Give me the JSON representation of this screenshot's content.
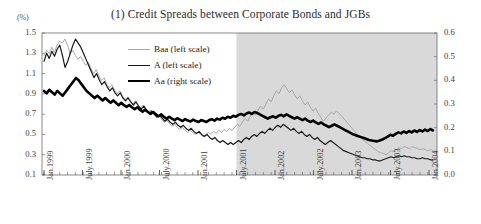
{
  "chart_data": {
    "type": "line",
    "title": "(1) Credit Spreads between Corporate Bonds and JGBs",
    "unit_label": "(%)",
    "xlabel": "",
    "ylabel_left": "",
    "ylabel_right": "",
    "grid": false,
    "legend_position": "upper-center-left",
    "left_axis": {
      "ticks": [
        "1.5",
        "1.3",
        "1.1",
        "0.9",
        "0.7",
        "0.5",
        "0.3",
        "0.1"
      ],
      "values": [
        1.5,
        1.3,
        1.1,
        0.9,
        0.7,
        0.5,
        0.3,
        0.1
      ],
      "ylim": [
        0.1,
        1.5
      ]
    },
    "right_axis": {
      "ticks": [
        "0.6",
        "0.5",
        "0.4",
        "0.3",
        "0.2",
        "0.1",
        "0.0"
      ],
      "values": [
        0.6,
        0.5,
        0.4,
        0.3,
        0.2,
        0.1,
        0.0
      ],
      "ylim": [
        0.0,
        0.6
      ]
    },
    "xticks": [
      "Jan.1999",
      "July.1999",
      "Jan.2000",
      "July.2000",
      "Jan.2001",
      "July.2001",
      "Jan.2002",
      "July.2002",
      "Jan.2003",
      "July.2003",
      "Jan.2004"
    ],
    "xlim": [
      "Jan.1999",
      "Jun.2004"
    ],
    "shaded_region": {
      "from": "July.2001",
      "to": "Jun.2004",
      "color": "#d2d2d2",
      "label": ""
    },
    "legend": [
      {
        "name": "Baa (left scale)",
        "series_key": "baa",
        "color": "#a8a8a8",
        "width": 1.0
      },
      {
        "name": "A (left scale)",
        "series_key": "a",
        "color": "#1a1a1a",
        "width": 1.2
      },
      {
        "name": "Aa (right scale)",
        "series_key": "aa",
        "color": "#000000",
        "width": 2.6
      }
    ],
    "series": [
      {
        "name": "Baa (left scale)",
        "axis": "left",
        "color": "#a8a8a8",
        "values": [
          1.28,
          1.33,
          1.3,
          1.36,
          1.31,
          1.38,
          1.42,
          1.4,
          1.44,
          1.38,
          1.3,
          1.33,
          1.28,
          1.24,
          1.27,
          1.22,
          1.18,
          1.21,
          1.15,
          1.1,
          1.14,
          1.08,
          1.03,
          1.06,
          1.0,
          0.96,
          0.99,
          0.94,
          0.9,
          0.93,
          0.88,
          0.84,
          0.87,
          0.83,
          0.8,
          0.83,
          0.79,
          0.76,
          0.79,
          0.75,
          0.72,
          0.74,
          0.7,
          0.67,
          0.69,
          0.65,
          0.62,
          0.64,
          0.61,
          0.58,
          0.6,
          0.57,
          0.55,
          0.57,
          0.54,
          0.52,
          0.54,
          0.52,
          0.5,
          0.52,
          0.5,
          0.48,
          0.5,
          0.52,
          0.5,
          0.53,
          0.51,
          0.54,
          0.52,
          0.55,
          0.53,
          0.56,
          0.54,
          0.57,
          0.6,
          0.58,
          0.62,
          0.66,
          0.63,
          0.68,
          0.72,
          0.69,
          0.74,
          0.78,
          0.75,
          0.8,
          0.85,
          0.82,
          0.88,
          0.93,
          0.9,
          0.96,
          0.99,
          0.95,
          0.91,
          0.94,
          0.89,
          0.85,
          0.88,
          0.83,
          0.79,
          0.82,
          0.77,
          0.73,
          0.76,
          0.71,
          0.67,
          0.63,
          0.66,
          0.69,
          0.72,
          0.7,
          0.73,
          0.71,
          0.68,
          0.65,
          0.62,
          0.59,
          0.56,
          0.53,
          0.5,
          0.48,
          0.45,
          0.43,
          0.41,
          0.39,
          0.37,
          0.35,
          0.33,
          0.32,
          0.31,
          0.3,
          0.32,
          0.34,
          0.33,
          0.35,
          0.37,
          0.36,
          0.38,
          0.37,
          0.36,
          0.38,
          0.37,
          0.36,
          0.35,
          0.36,
          0.35,
          0.34,
          0.35,
          0.34
        ],
        "peak": {
          "value": 0.99,
          "at": "Jun.2002"
        },
        "start": 1.28,
        "end": 0.34
      },
      {
        "name": "A (left scale)",
        "axis": "left",
        "color": "#1a1a1a",
        "values": [
          1.22,
          1.3,
          1.25,
          1.32,
          1.27,
          1.34,
          1.38,
          1.28,
          1.16,
          1.22,
          1.3,
          1.38,
          1.44,
          1.4,
          1.36,
          1.3,
          1.24,
          1.18,
          1.12,
          1.06,
          1.1,
          1.04,
          0.99,
          1.02,
          0.97,
          0.93,
          0.96,
          0.91,
          0.88,
          0.91,
          0.86,
          0.83,
          0.86,
          0.82,
          0.79,
          0.82,
          0.78,
          0.75,
          0.78,
          0.74,
          0.71,
          0.73,
          0.7,
          0.67,
          0.69,
          0.66,
          0.63,
          0.65,
          0.62,
          0.6,
          0.62,
          0.59,
          0.57,
          0.59,
          0.56,
          0.54,
          0.56,
          0.53,
          0.51,
          0.53,
          0.5,
          0.48,
          0.5,
          0.47,
          0.45,
          0.47,
          0.44,
          0.42,
          0.44,
          0.42,
          0.4,
          0.42,
          0.4,
          0.42,
          0.44,
          0.42,
          0.45,
          0.47,
          0.45,
          0.48,
          0.5,
          0.48,
          0.51,
          0.53,
          0.51,
          0.54,
          0.56,
          0.54,
          0.57,
          0.59,
          0.57,
          0.6,
          0.58,
          0.56,
          0.54,
          0.56,
          0.53,
          0.51,
          0.53,
          0.5,
          0.48,
          0.5,
          0.47,
          0.45,
          0.47,
          0.44,
          0.42,
          0.4,
          0.42,
          0.44,
          0.42,
          0.4,
          0.38,
          0.36,
          0.34,
          0.33,
          0.32,
          0.31,
          0.3,
          0.29,
          0.28,
          0.27,
          0.27,
          0.26,
          0.26,
          0.25,
          0.25,
          0.24,
          0.24,
          0.25,
          0.26,
          0.27,
          0.28,
          0.27,
          0.28,
          0.29,
          0.28,
          0.29,
          0.28,
          0.28,
          0.27,
          0.27,
          0.26,
          0.26,
          0.27,
          0.26,
          0.26,
          0.25,
          0.25
        ],
        "start": 1.22,
        "end": 0.25
      },
      {
        "name": "Aa (right scale)",
        "axis": "right",
        "color": "#000000",
        "values": [
          0.355,
          0.345,
          0.36,
          0.35,
          0.34,
          0.355,
          0.345,
          0.335,
          0.35,
          0.365,
          0.38,
          0.395,
          0.41,
          0.4,
          0.385,
          0.37,
          0.355,
          0.345,
          0.335,
          0.325,
          0.335,
          0.325,
          0.315,
          0.325,
          0.315,
          0.305,
          0.315,
          0.305,
          0.295,
          0.305,
          0.295,
          0.288,
          0.296,
          0.286,
          0.278,
          0.286,
          0.276,
          0.268,
          0.276,
          0.266,
          0.258,
          0.266,
          0.256,
          0.248,
          0.256,
          0.246,
          0.238,
          0.246,
          0.238,
          0.232,
          0.24,
          0.234,
          0.228,
          0.236,
          0.23,
          0.226,
          0.234,
          0.228,
          0.224,
          0.232,
          0.228,
          0.224,
          0.232,
          0.236,
          0.23,
          0.238,
          0.234,
          0.242,
          0.238,
          0.246,
          0.242,
          0.25,
          0.246,
          0.254,
          0.258,
          0.252,
          0.26,
          0.264,
          0.258,
          0.266,
          0.262,
          0.256,
          0.25,
          0.244,
          0.238,
          0.244,
          0.248,
          0.242,
          0.25,
          0.254,
          0.248,
          0.256,
          0.25,
          0.244,
          0.238,
          0.244,
          0.238,
          0.232,
          0.238,
          0.23,
          0.224,
          0.23,
          0.222,
          0.216,
          0.222,
          0.214,
          0.208,
          0.202,
          0.208,
          0.214,
          0.208,
          0.202,
          0.196,
          0.19,
          0.184,
          0.178,
          0.172,
          0.168,
          0.164,
          0.16,
          0.156,
          0.152,
          0.148,
          0.146,
          0.144,
          0.142,
          0.146,
          0.15,
          0.156,
          0.162,
          0.17,
          0.166,
          0.174,
          0.18,
          0.176,
          0.184,
          0.178,
          0.186,
          0.18,
          0.188,
          0.182,
          0.19,
          0.184,
          0.192,
          0.186,
          0.194,
          0.188
        ],
        "start": 0.355,
        "end": 0.188
      }
    ]
  }
}
